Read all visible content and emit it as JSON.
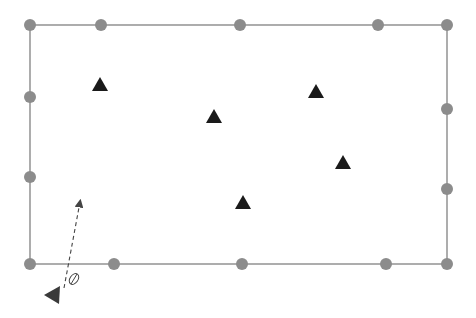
{
  "diagram": {
    "type": "sensor-layout",
    "colors": {
      "boundary": "#8a8a8a",
      "node": "#8c8c8c",
      "target": "#1a1a1a",
      "agent": "#3a3a3a",
      "arrow": "#444444"
    },
    "boundary": {
      "x": 30,
      "y": 25,
      "width": 417,
      "height": 239
    },
    "nodes": [
      {
        "x": 30,
        "y": 25
      },
      {
        "x": 101,
        "y": 25
      },
      {
        "x": 240,
        "y": 25
      },
      {
        "x": 378,
        "y": 25
      },
      {
        "x": 447,
        "y": 25
      },
      {
        "x": 447,
        "y": 109
      },
      {
        "x": 447,
        "y": 189
      },
      {
        "x": 447,
        "y": 264
      },
      {
        "x": 386,
        "y": 264
      },
      {
        "x": 242,
        "y": 264
      },
      {
        "x": 114,
        "y": 264
      },
      {
        "x": 30,
        "y": 264
      },
      {
        "x": 30,
        "y": 177
      },
      {
        "x": 30,
        "y": 97
      }
    ],
    "targets": [
      {
        "x": 100,
        "y": 85
      },
      {
        "x": 214,
        "y": 117
      },
      {
        "x": 316,
        "y": 92
      },
      {
        "x": 343,
        "y": 163
      },
      {
        "x": 243,
        "y": 203
      }
    ],
    "agent": {
      "x": 52,
      "y": 295,
      "direction": "left"
    },
    "heading_arrow": {
      "x1": 64,
      "y1": 288,
      "x2": 80,
      "y2": 202,
      "style": "dashed"
    },
    "angle_symbol": {
      "x": 74,
      "y": 279,
      "label": "⌀"
    }
  }
}
